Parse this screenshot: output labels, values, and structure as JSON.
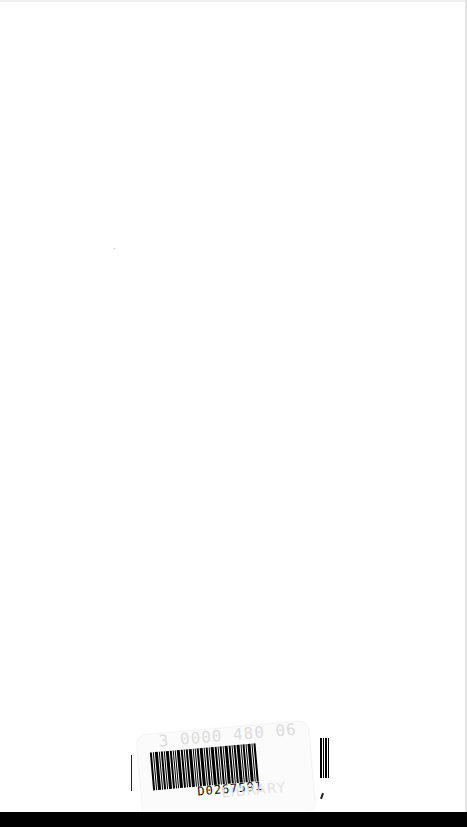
{
  "page": {
    "type": "scanned blank book page",
    "background": "#ffffff"
  },
  "barcode_sticker": {
    "barcode_number": "D0267591",
    "ghost_number": "3 0000 480 06",
    "ghost_text": "LIBRARY"
  },
  "bottom_band_color": "#000000"
}
